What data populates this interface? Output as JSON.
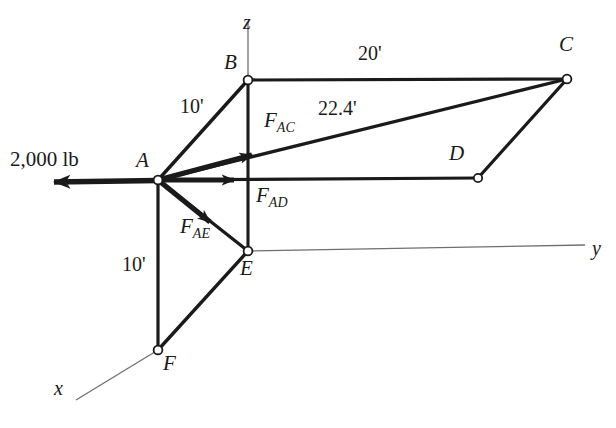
{
  "figure": {
    "kind": "space-truss-free-body-diagram",
    "background_color": "#ffffff",
    "ink_color": "#1a1a1a",
    "axis_color": "#6a6a6a",
    "width": 616,
    "height": 428
  },
  "axes": [
    {
      "name": "z",
      "label": "z",
      "x": 243,
      "y": 12
    },
    {
      "name": "y",
      "label": "y",
      "x": 592,
      "y": 238
    },
    {
      "name": "x",
      "label": "x",
      "x": 54,
      "y": 378
    }
  ],
  "points": [
    {
      "name": "A",
      "label": "A",
      "cx": 158,
      "cy": 180,
      "lx": 136,
      "ly": 150
    },
    {
      "name": "B",
      "label": "B",
      "cx": 248,
      "cy": 80,
      "lx": 224,
      "ly": 52
    },
    {
      "name": "C",
      "label": "C",
      "cx": 567,
      "cy": 79,
      "lx": 559,
      "ly": 34
    },
    {
      "name": "D",
      "label": "D",
      "cx": 478,
      "cy": 178,
      "lx": 449,
      "ly": 143
    },
    {
      "name": "E",
      "label": "E",
      "cx": 248,
      "cy": 251,
      "lx": 240,
      "ly": 258
    },
    {
      "name": "F",
      "label": "F",
      "cx": 158,
      "cy": 350,
      "lx": 163,
      "ly": 353
    }
  ],
  "dimensions": [
    {
      "name": "dim-ab",
      "label": "10'",
      "x": 180,
      "y": 96,
      "member": "A-B"
    },
    {
      "name": "dim-af",
      "label": "10'",
      "x": 122,
      "y": 254,
      "member": "A-F"
    },
    {
      "name": "dim-bc",
      "label": "20'",
      "x": 358,
      "y": 43,
      "member": "B-C"
    },
    {
      "name": "dim-ac",
      "label": "22.4'",
      "x": 318,
      "y": 98,
      "member": "A-C"
    }
  ],
  "applied_load": {
    "name": "applied-load",
    "label": "2,000 lb",
    "x": 10,
    "y": 149,
    "from": {
      "x": 158,
      "y": 180
    },
    "to": {
      "x": 36,
      "y": 182
    }
  },
  "force_vectors": [
    {
      "name": "force-ac",
      "symbol": "F",
      "subscript": "AC",
      "lx": 264,
      "ly": 110,
      "from": {
        "x": 158,
        "y": 180
      },
      "to": {
        "x": 266,
        "y": 151
      }
    },
    {
      "name": "force-ad",
      "symbol": "F",
      "subscript": "AD",
      "lx": 256,
      "ly": 185,
      "from": {
        "x": 158,
        "y": 180
      },
      "to": {
        "x": 247,
        "y": 180
      }
    },
    {
      "name": "force-ae",
      "symbol": "F",
      "subscript": "AE",
      "lx": 180,
      "ly": 216,
      "from": {
        "x": 158,
        "y": 180
      },
      "to": {
        "x": 222,
        "y": 231
      }
    }
  ],
  "members": [
    {
      "name": "member-ab",
      "from": "A",
      "to": "B",
      "weight": "thick"
    },
    {
      "name": "member-be",
      "from": "B",
      "to": "E",
      "weight": "thick"
    },
    {
      "name": "member-bc",
      "from": "B",
      "to": "C",
      "weight": "thick"
    },
    {
      "name": "member-ac",
      "from": "A",
      "to": "C",
      "weight": "thick"
    },
    {
      "name": "member-ad",
      "from": "A",
      "to": "D",
      "weight": "thick"
    },
    {
      "name": "member-cd",
      "from": "C",
      "to": "D",
      "weight": "thick"
    },
    {
      "name": "member-af",
      "from": "A",
      "to": "F",
      "weight": "thick"
    },
    {
      "name": "member-ef",
      "from": "E",
      "to": "F",
      "weight": "thick"
    },
    {
      "name": "member-ae",
      "from": "A",
      "to": "E",
      "weight": "thick"
    }
  ]
}
